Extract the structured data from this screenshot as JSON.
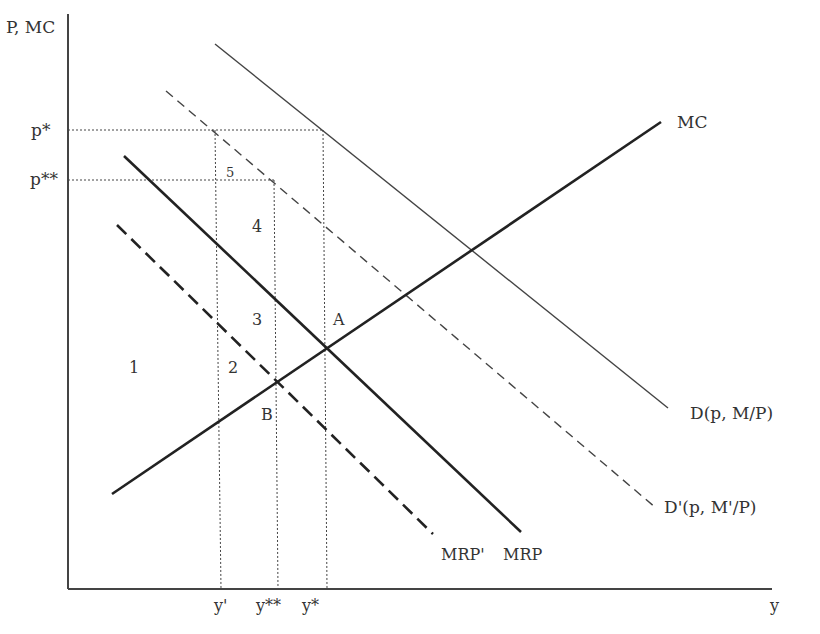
{
  "axes": {
    "y_label": "P, MC",
    "x_label": "y"
  },
  "price_ticks": [
    {
      "label": "p*",
      "y": 130
    },
    {
      "label": "p**",
      "y": 180
    }
  ],
  "quantity_ticks": [
    {
      "label": "y'",
      "x": 220
    },
    {
      "label": "y**",
      "x": 276
    },
    {
      "label": "y*",
      "x": 326
    }
  ],
  "curves": [
    {
      "id": "D",
      "label": "D(p, M/P)",
      "style": "thin-solid"
    },
    {
      "id": "D_prime",
      "label": "D'(p, M'/P)",
      "style": "thin-dashed"
    },
    {
      "id": "MRP",
      "label": "MRP",
      "style": "thick-solid"
    },
    {
      "id": "MRP_prime",
      "label": "MRP'",
      "style": "thick-dashed"
    },
    {
      "id": "MC",
      "label": "MC",
      "style": "thick-solid"
    }
  ],
  "points": [
    {
      "label": "A"
    },
    {
      "label": "B"
    }
  ],
  "regions": [
    "1",
    "2",
    "3",
    "4",
    "5"
  ],
  "colors": {
    "ink": "#333333",
    "background": "#ffffff"
  }
}
